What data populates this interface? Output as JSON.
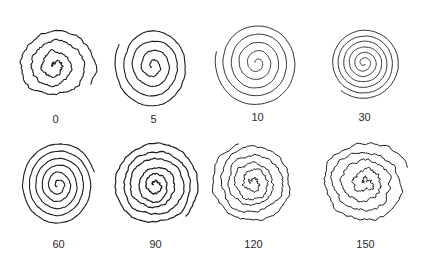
{
  "figure": {
    "panels": [
      {
        "label": "0",
        "cx": 55,
        "cy": 66,
        "turns": 3.6,
        "rx": 40,
        "ry": 38,
        "jitter": 2.2,
        "stroke": 1.1,
        "start": 3.0
      },
      {
        "label": "5",
        "cx": 153,
        "cy": 66,
        "turns": 4.2,
        "rx": 38,
        "ry": 43,
        "jitter": 0.8,
        "stroke": 1.1,
        "start": 2.4
      },
      {
        "label": "10",
        "cx": 257,
        "cy": 63,
        "turns": 5.0,
        "rx": 42,
        "ry": 44,
        "jitter": 0.4,
        "stroke": 0.9,
        "start": 3.4
      },
      {
        "label": "30",
        "cx": 364,
        "cy": 63,
        "turns": 6.2,
        "rx": 36,
        "ry": 36,
        "jitter": 0.3,
        "stroke": 0.9,
        "start": 1.0
      },
      {
        "label": "60",
        "cx": 58,
        "cy": 185,
        "turns": 5.6,
        "rx": 38,
        "ry": 43,
        "jitter": 0.6,
        "stroke": 1.1,
        "start": 2.2
      },
      {
        "label": "90",
        "cx": 155,
        "cy": 185,
        "turns": 5.6,
        "rx": 44,
        "ry": 44,
        "jitter": 1.6,
        "stroke": 1.2,
        "start": 3.3
      },
      {
        "label": "120",
        "cx": 253,
        "cy": 183,
        "turns": 5.2,
        "rx": 42,
        "ry": 42,
        "jitter": 2.4,
        "stroke": 1.0,
        "start": 3.1
      },
      {
        "label": "150",
        "cx": 365,
        "cy": 183,
        "turns": 4.4,
        "rx": 44,
        "ry": 42,
        "jitter": 3.0,
        "stroke": 1.0,
        "start": 3.4
      }
    ],
    "ink_color": "#1c1c1c",
    "label_color": "#2a2a2a"
  }
}
